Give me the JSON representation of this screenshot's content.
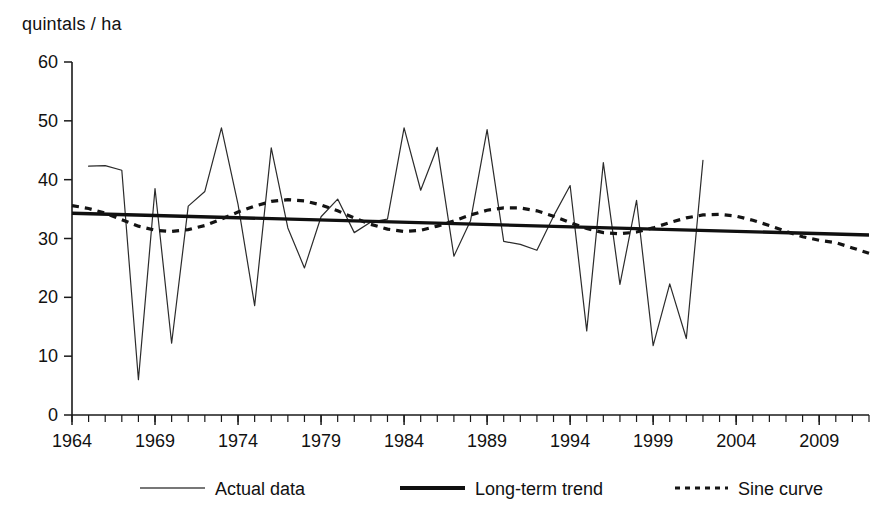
{
  "chart_data": {
    "type": "line",
    "title": "",
    "ylabel": "quintals / ha",
    "xlabel": "",
    "ylim": [
      0,
      60
    ],
    "xlim": [
      1964,
      2012
    ],
    "y_ticks": [
      0,
      10,
      20,
      30,
      40,
      50,
      60
    ],
    "x_ticks": [
      1964,
      1969,
      1974,
      1979,
      1984,
      1989,
      1994,
      1999,
      2004,
      2009
    ],
    "x_tick_labels": [
      "1964",
      "1969",
      "1974",
      "1979",
      "1984",
      "1989",
      "1994",
      "1999",
      "2004",
      "2009"
    ],
    "y_tick_labels": [
      "0",
      "10",
      "20",
      "30",
      "40",
      "50",
      "60"
    ],
    "x_minor_tick_interval": 1,
    "grid": false,
    "legend_position": "bottom",
    "series": [
      {
        "name": "Actual data",
        "style": "thin-solid",
        "x": [
          1965,
          1966,
          1967,
          1968,
          1969,
          1970,
          1971,
          1972,
          1973,
          1974,
          1975,
          1976,
          1977,
          1978,
          1979,
          1980,
          1981,
          1982,
          1983,
          1984,
          1985,
          1986,
          1987,
          1988,
          1989,
          1990,
          1991,
          1992,
          1993,
          1994,
          1995,
          1996,
          1997,
          1998,
          1999,
          2000,
          2001,
          2002
        ],
        "values": [
          42.3,
          42.4,
          41.6,
          6.0,
          38.5,
          12.2,
          35.5,
          38.0,
          48.8,
          35.8,
          18.6,
          45.4,
          31.8,
          25.0,
          33.7,
          36.7,
          31.0,
          32.8,
          33.3,
          48.8,
          38.2,
          45.5,
          27.0,
          33.0,
          48.5,
          29.5,
          29.0,
          28.0,
          33.8,
          39.0,
          14.3,
          42.9,
          22.2,
          36.5,
          11.8,
          22.3,
          13.0,
          43.3
        ]
      },
      {
        "name": "Long-term trend",
        "style": "thick-solid",
        "x": [
          1964,
          2012
        ],
        "values": [
          34.3,
          30.6
        ]
      },
      {
        "name": "Sine curve",
        "style": "dotted",
        "x": [
          1964,
          1965,
          1966,
          1967,
          1968,
          1969,
          1970,
          1971,
          1972,
          1973,
          1974,
          1975,
          1976,
          1977,
          1978,
          1979,
          1980,
          1981,
          1982,
          1983,
          1984,
          1985,
          1986,
          1987,
          1988,
          1989,
          1990,
          1991,
          1992,
          1993,
          1994,
          1995,
          1996,
          1997,
          1998,
          1999,
          2000,
          2001,
          2002,
          2003,
          2004,
          2005,
          2006,
          2007,
          2008,
          2009,
          2010,
          2011,
          2012
        ],
        "values": [
          35.6,
          35.1,
          34.3,
          33.2,
          32.1,
          31.4,
          31.2,
          31.5,
          32.2,
          33.3,
          34.5,
          35.5,
          36.3,
          36.6,
          36.4,
          35.7,
          34.7,
          33.5,
          32.4,
          31.6,
          31.2,
          31.4,
          32.1,
          33.0,
          34.0,
          34.8,
          35.2,
          35.2,
          34.7,
          33.8,
          32.7,
          31.7,
          31.0,
          30.8,
          31.1,
          31.8,
          32.7,
          33.5,
          34.0,
          34.1,
          33.8,
          33.1,
          32.2,
          31.2,
          30.3,
          29.7,
          29.3,
          28.4,
          27.5
        ]
      }
    ]
  },
  "legend": {
    "items": [
      {
        "label": "Actual data",
        "style": "thin-solid"
      },
      {
        "label": "Long-term trend",
        "style": "thick-solid"
      },
      {
        "label": "Sine curve",
        "style": "dotted"
      }
    ]
  },
  "colors": {
    "actual": "#2b2b2b",
    "trend": "#101010",
    "sine": "#141414",
    "axis": "#1a1a1a",
    "background": "#ffffff"
  }
}
